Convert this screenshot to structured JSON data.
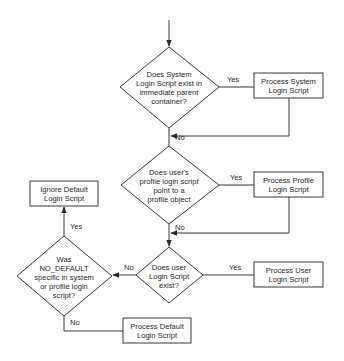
{
  "diagram": {
    "type": "flowchart",
    "nodes": [
      {
        "id": "d1",
        "kind": "decision",
        "lines": [
          "Does System",
          "Login Script exist in",
          "immediate parent",
          "container?"
        ]
      },
      {
        "id": "b1",
        "kind": "process",
        "lines": [
          "Process System",
          "Login Script"
        ]
      },
      {
        "id": "d2",
        "kind": "decision",
        "lines": [
          "Does user's",
          "profile login script",
          "point to a",
          "profile object"
        ]
      },
      {
        "id": "b2",
        "kind": "process",
        "lines": [
          "Process Profile",
          "Login Script"
        ]
      },
      {
        "id": "d3",
        "kind": "decision",
        "lines": [
          "Does user",
          "Login Script",
          "exist?"
        ]
      },
      {
        "id": "b3",
        "kind": "process",
        "lines": [
          "Process User",
          "Login Script"
        ]
      },
      {
        "id": "d4",
        "kind": "decision",
        "lines": [
          "Was",
          "NO_DEFAULT",
          "specific in system",
          "or profile login",
          "script?"
        ]
      },
      {
        "id": "b4",
        "kind": "process",
        "lines": [
          "Ignore Default",
          "Login Script"
        ]
      },
      {
        "id": "b5",
        "kind": "process",
        "lines": [
          "Process Default",
          "Login Script"
        ]
      }
    ],
    "edges": [
      {
        "from": "start",
        "to": "d1",
        "label": ""
      },
      {
        "from": "d1",
        "to": "b1",
        "label": "Yes"
      },
      {
        "from": "d1",
        "to": "d2",
        "label": "No"
      },
      {
        "from": "b1",
        "to": "d2",
        "label": ""
      },
      {
        "from": "d2",
        "to": "b2",
        "label": "Yes"
      },
      {
        "from": "d2",
        "to": "d3",
        "label": "No"
      },
      {
        "from": "b2",
        "to": "d3",
        "label": ""
      },
      {
        "from": "d3",
        "to": "b3",
        "label": "Yes"
      },
      {
        "from": "d3",
        "to": "d4",
        "label": "No"
      },
      {
        "from": "d4",
        "to": "b4",
        "label": "Yes"
      },
      {
        "from": "d4",
        "to": "b5",
        "label": "No"
      }
    ],
    "labels": {
      "yes": "Yes",
      "no": "No"
    }
  }
}
